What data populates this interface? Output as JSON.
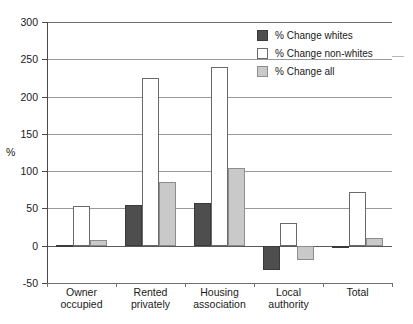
{
  "chart_data": {
    "type": "bar",
    "title": "",
    "xlabel": "",
    "ylabel": "%",
    "ylim": [
      -50,
      300
    ],
    "ytick_step": 50,
    "yticks": [
      300,
      250,
      200,
      150,
      100,
      50,
      0,
      -50
    ],
    "ytick_labels": [
      "300",
      "250",
      "200",
      "150",
      "100",
      "50",
      "0",
      "-50"
    ],
    "grid": true,
    "legend_position": "top-right",
    "categories": [
      "Owner occupied",
      "Rented privately",
      "Housing association",
      "Local authority",
      "Total"
    ],
    "category_lines": [
      [
        "Owner",
        "occupied"
      ],
      [
        "Rented",
        "privately"
      ],
      [
        "Housing",
        "association"
      ],
      [
        "Local",
        "authority"
      ],
      [
        "Total",
        ""
      ]
    ],
    "series": [
      {
        "name": "% Change whites",
        "color": "#4e4e4e",
        "values": [
          1,
          54,
          57,
          -33,
          -2
        ]
      },
      {
        "name": "% Change non-whites",
        "color": "#ffffff",
        "values": [
          53,
          225,
          239,
          30,
          72
        ]
      },
      {
        "name": "% Change all",
        "color": "#c9c9c9",
        "values": [
          8,
          85,
          104,
          -19,
          10
        ]
      }
    ]
  },
  "legend": {
    "items": [
      {
        "label": "% Change whites",
        "swatch": "whites"
      },
      {
        "label": "% Change non-whites",
        "swatch": "nonwhites"
      },
      {
        "label": "% Change all",
        "swatch": "all"
      }
    ]
  },
  "axis": {
    "y_title": "%"
  }
}
